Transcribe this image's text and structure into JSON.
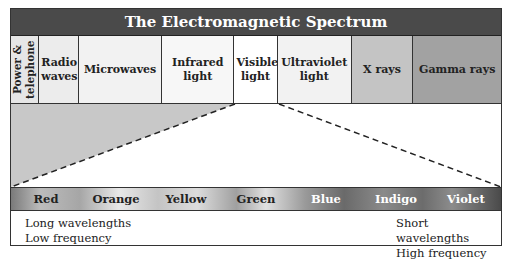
{
  "title": "The Electromagnetic Spectrum",
  "bands": [
    {
      "label": "Power & telephone",
      "width": 28,
      "bg": "#e6e6e6",
      "vertical": true
    },
    {
      "label": "Radio waves",
      "width": 40,
      "bg": "#ececec"
    },
    {
      "label": "Microwaves",
      "width": 84,
      "bg": "#f2f2f2"
    },
    {
      "label": "Infrared light",
      "width": 72,
      "bg": "#f7f7f7"
    },
    {
      "label": "Visible light",
      "width": 44,
      "bg": "#ffffff"
    },
    {
      "label": "Ultraviolet light",
      "width": 74,
      "bg": "#f2f2f2"
    },
    {
      "label": "X rays",
      "width": 62,
      "bg": "#c4c4c4"
    },
    {
      "label": "Gamma rays",
      "width": 88,
      "bg": "#a2a2a2"
    }
  ],
  "colors": [
    {
      "label": "Red",
      "tone": "dark"
    },
    {
      "label": "Orange",
      "tone": "dark"
    },
    {
      "label": "Yellow",
      "tone": "dark"
    },
    {
      "label": "Green",
      "tone": "dark"
    },
    {
      "label": "Blue",
      "tone": "light"
    },
    {
      "label": "Indigo",
      "tone": "light"
    },
    {
      "label": "Violet",
      "tone": "light"
    }
  ],
  "left_note": {
    "line1": "Long wavelengths",
    "line2": "Low frequency"
  },
  "right_note": {
    "line1": "Short wavelengths",
    "line2": "High frequency"
  }
}
